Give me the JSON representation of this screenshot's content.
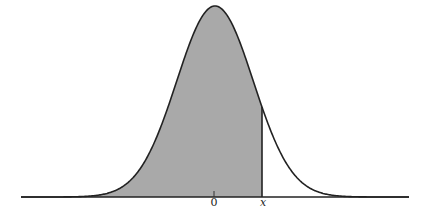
{
  "figure": {
    "axis_labels": {
      "zero": "0",
      "x": "x"
    },
    "colors": {
      "shade": "#a9a9a9",
      "curve": "#222222",
      "background": "#ffffff"
    },
    "geometry": {
      "baseline_y": 197,
      "x_start": 21,
      "x_end": 409,
      "mean_px": 215,
      "sigma_px": 38.3,
      "peak_height_px": 191,
      "cut_px": 262
    }
  }
}
